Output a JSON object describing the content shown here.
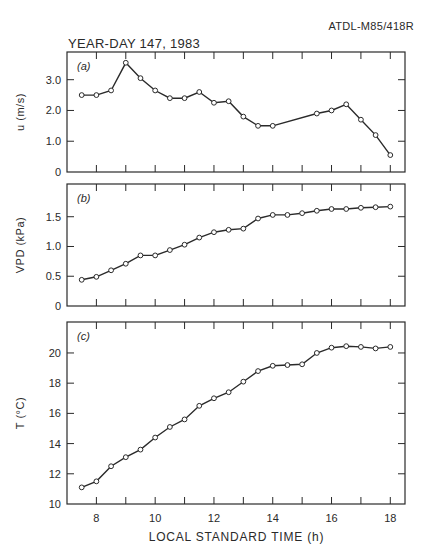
{
  "header": {
    "doc_id": "ATDL-M85/418R",
    "title": "YEAR-DAY 147, 1983"
  },
  "chart_data": {
    "type": "line",
    "title": "YEAR-DAY 147, 1983",
    "xlabel": "LOCAL STANDARD TIME (h)",
    "xlim": [
      7.0,
      18.5
    ],
    "xticks": [
      8,
      9,
      10,
      11,
      12,
      13,
      14,
      15,
      16,
      17,
      18
    ],
    "xtick_labels": [
      "8",
      "10",
      "12",
      "14",
      "16",
      "18"
    ],
    "grid": false,
    "marker": "open-circle",
    "panels": [
      {
        "label": "(a)",
        "ylabel": "u (m/s)",
        "ylim": [
          0,
          3.9
        ],
        "yticks": [
          0,
          1.0,
          2.0,
          3.0
        ],
        "ytick_labels": [
          "0",
          "1.0",
          "2.0",
          "3.0"
        ],
        "x": [
          7.5,
          8.0,
          8.5,
          9.0,
          9.5,
          10.0,
          10.5,
          11.0,
          11.5,
          12.0,
          12.5,
          13.0,
          13.5,
          14.0,
          15.5,
          16.0,
          16.5,
          17.0,
          17.5,
          18.0
        ],
        "values": [
          2.5,
          2.5,
          2.65,
          3.55,
          3.05,
          2.65,
          2.4,
          2.4,
          2.6,
          2.25,
          2.3,
          1.8,
          1.5,
          1.5,
          1.9,
          2.0,
          2.2,
          1.7,
          1.2,
          0.55
        ]
      },
      {
        "label": "(b)",
        "ylabel": "VPD (kPa)",
        "ylim": [
          0,
          2.05
        ],
        "yticks": [
          0,
          0.5,
          1.0,
          1.5
        ],
        "ytick_labels": [
          "0",
          "0.5",
          "1.0",
          "1.5"
        ],
        "x": [
          7.5,
          8.0,
          8.5,
          9.0,
          9.5,
          10.0,
          10.5,
          11.0,
          11.5,
          12.0,
          12.5,
          13.0,
          13.5,
          14.0,
          14.5,
          15.0,
          15.5,
          16.0,
          16.5,
          17.0,
          17.5,
          18.0
        ],
        "values": [
          0.44,
          0.49,
          0.6,
          0.71,
          0.85,
          0.85,
          0.94,
          1.03,
          1.15,
          1.24,
          1.28,
          1.3,
          1.47,
          1.53,
          1.53,
          1.56,
          1.6,
          1.63,
          1.63,
          1.65,
          1.66,
          1.67
        ]
      },
      {
        "label": "(c)",
        "ylabel": "T (°C)",
        "ylim": [
          10,
          22.05
        ],
        "yticks": [
          10,
          12,
          14,
          16,
          18,
          20
        ],
        "ytick_labels": [
          "10",
          "12",
          "14",
          "16",
          "18",
          "20"
        ],
        "x": [
          7.5,
          8.0,
          8.5,
          9.0,
          9.5,
          10.0,
          10.5,
          11.0,
          11.5,
          12.0,
          12.5,
          13.0,
          13.5,
          14.0,
          14.5,
          15.0,
          15.5,
          16.0,
          16.5,
          17.0,
          17.5,
          18.0
        ],
        "values": [
          11.1,
          11.5,
          12.5,
          13.1,
          13.6,
          14.4,
          15.1,
          15.6,
          16.5,
          17.0,
          17.4,
          18.1,
          18.8,
          19.15,
          19.2,
          19.25,
          20.0,
          20.35,
          20.45,
          20.4,
          20.3,
          20.4
        ]
      }
    ]
  },
  "colors": {
    "ink": "#2a2a2a",
    "background": "#ffffff"
  }
}
